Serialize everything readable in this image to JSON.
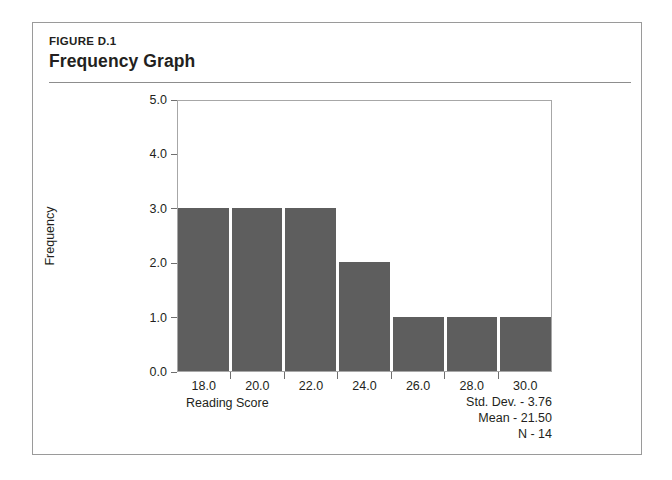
{
  "figure": {
    "label": "FIGURE D.1",
    "title": "Frequency Graph"
  },
  "chart_data": {
    "type": "bar",
    "title": "Frequency Graph",
    "xlabel": "Reading Score",
    "ylabel": "Frequency",
    "categories": [
      "18.0",
      "20.0",
      "22.0",
      "24.0",
      "26.0",
      "28.0",
      "30.0"
    ],
    "values": [
      3,
      3,
      3,
      2,
      1,
      1,
      1
    ],
    "ylim": [
      0.0,
      5.0
    ],
    "ytick_labels": [
      "0.0",
      "1.0",
      "2.0",
      "3.0",
      "4.0",
      "5.0"
    ],
    "ytick_values": [
      0,
      1,
      2,
      3,
      4,
      5
    ],
    "xtick_labels": [
      "18.0",
      "20.0",
      "22.0",
      "24.0",
      "26.0",
      "28.0",
      "30.0"
    ],
    "grid": false,
    "legend": "none",
    "bar_color": "#5e5e5e"
  },
  "statistics": {
    "std_dev": "Std. Dev. - 3.76",
    "mean": "Mean - 21.50",
    "n": "N - 14"
  }
}
